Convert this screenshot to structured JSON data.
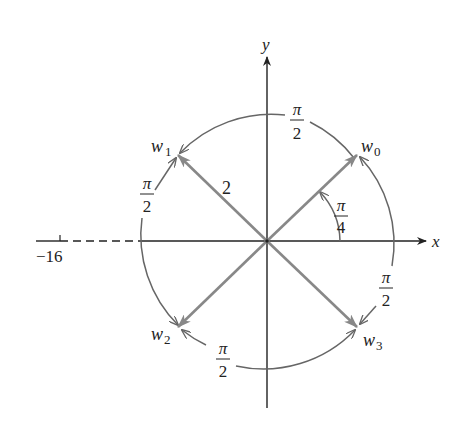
{
  "figure": {
    "axes": {
      "x_label": "x",
      "y_label": "y",
      "negative_tick_label": "−16"
    },
    "circle": {
      "radius_label": "2"
    },
    "roots": [
      {
        "name": "w",
        "sub": "0",
        "angle": "π/4"
      },
      {
        "name": "w",
        "sub": "1",
        "angle": "3π/4"
      },
      {
        "name": "w",
        "sub": "2",
        "angle": "5π/4"
      },
      {
        "name": "w",
        "sub": "3",
        "angle": "7π/4"
      }
    ],
    "angle_labels": {
      "initial": {
        "num": "π",
        "den": "4"
      },
      "top_arc": {
        "num": "π",
        "den": "2"
      },
      "left_arc": {
        "num": "π",
        "den": "2"
      },
      "bottom_arc": {
        "num": "π",
        "den": "2"
      },
      "right_arc": {
        "num": "π",
        "den": "2"
      }
    },
    "colors": {
      "axis": "#222222",
      "vector": "#888888",
      "arc": "#666666",
      "text": "#222222"
    }
  }
}
